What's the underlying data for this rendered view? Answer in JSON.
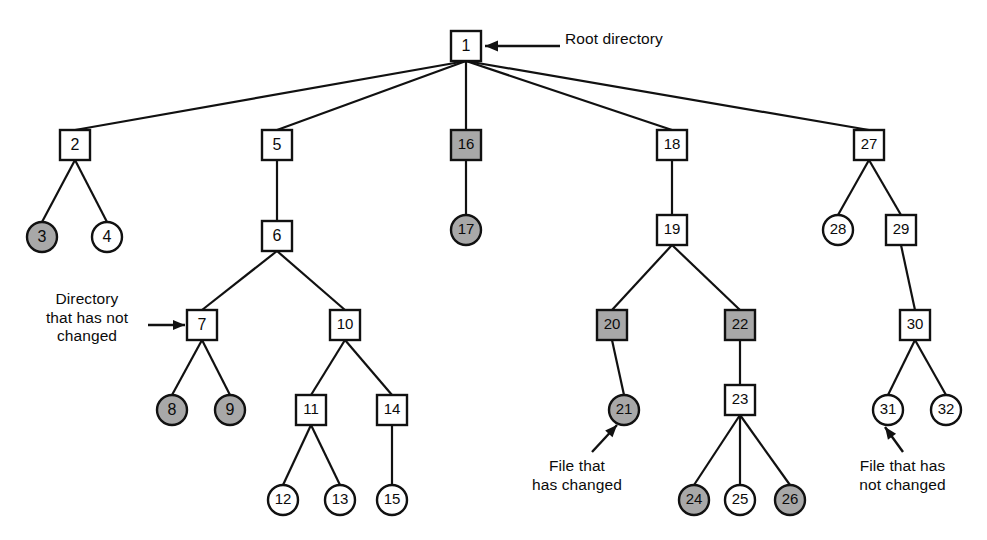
{
  "diagram": {
    "colors": {
      "stroke": "#111111",
      "node_fill_unchanged": "#ffffff",
      "node_fill_changed": "#a8a8a8",
      "background": "#ffffff",
      "text": "#0b0b0b"
    },
    "legend": {
      "root_label": "Root directory",
      "directory_unchanged_label": "Directory\nthat has not\nchanged",
      "file_changed_label": "File that\nhas changed",
      "file_unchanged_label": "File that has\nnot changed"
    },
    "shape_meaning": {
      "square": "directory",
      "circle": "file",
      "gray": "changed since last dump",
      "white": "not changed since last dump"
    },
    "nodes": [
      {
        "id": "1",
        "label": "1",
        "shape": "square",
        "state": "changed",
        "x": 466,
        "y": 46
      },
      {
        "id": "2",
        "label": "2",
        "shape": "square",
        "state": "changed",
        "x": 75,
        "y": 145
      },
      {
        "id": "3",
        "label": "3",
        "shape": "circle",
        "state": "changed",
        "x": 42,
        "y": 237
      },
      {
        "id": "4",
        "label": "4",
        "shape": "circle",
        "state": "unchanged",
        "x": 107,
        "y": 237
      },
      {
        "id": "5",
        "label": "5",
        "shape": "square",
        "state": "changed",
        "x": 277,
        "y": 145
      },
      {
        "id": "6",
        "label": "6",
        "shape": "square",
        "state": "changed",
        "x": 277,
        "y": 236
      },
      {
        "id": "7",
        "label": "7",
        "shape": "square",
        "state": "unchanged",
        "x": 202,
        "y": 325
      },
      {
        "id": "8",
        "label": "8",
        "shape": "circle",
        "state": "changed",
        "x": 172,
        "y": 410
      },
      {
        "id": "9",
        "label": "9",
        "shape": "circle",
        "state": "changed",
        "x": 230,
        "y": 410
      },
      {
        "id": "10",
        "label": "10",
        "shape": "square",
        "state": "changed",
        "x": 345,
        "y": 325
      },
      {
        "id": "11",
        "label": "11",
        "shape": "square",
        "state": "changed",
        "x": 311,
        "y": 410
      },
      {
        "id": "12",
        "label": "12",
        "shape": "circle",
        "state": "unchanged",
        "x": 283,
        "y": 500
      },
      {
        "id": "13",
        "label": "13",
        "shape": "circle",
        "state": "unchanged",
        "x": 340,
        "y": 500
      },
      {
        "id": "14",
        "label": "14",
        "shape": "square",
        "state": "changed",
        "x": 392,
        "y": 410
      },
      {
        "id": "15",
        "label": "15",
        "shape": "circle",
        "state": "unchanged",
        "x": 392,
        "y": 500
      },
      {
        "id": "16",
        "label": "16",
        "shape": "square",
        "state": "changed",
        "x": 466,
        "y": 145
      },
      {
        "id": "17",
        "label": "17",
        "shape": "circle",
        "state": "changed",
        "x": 466,
        "y": 230
      },
      {
        "id": "18",
        "label": "18",
        "shape": "square",
        "state": "changed",
        "x": 672,
        "y": 145
      },
      {
        "id": "19",
        "label": "19",
        "shape": "square",
        "state": "changed",
        "x": 672,
        "y": 230
      },
      {
        "id": "20",
        "label": "20",
        "shape": "square",
        "state": "changed",
        "x": 612,
        "y": 325
      },
      {
        "id": "21",
        "label": "21",
        "shape": "circle",
        "state": "changed",
        "x": 624,
        "y": 410
      },
      {
        "id": "22",
        "label": "22",
        "shape": "square",
        "state": "changed",
        "x": 740,
        "y": 325
      },
      {
        "id": "23",
        "label": "23",
        "shape": "square",
        "state": "unchanged",
        "x": 740,
        "y": 400
      },
      {
        "id": "24",
        "label": "24",
        "shape": "circle",
        "state": "changed",
        "x": 694,
        "y": 500
      },
      {
        "id": "25",
        "label": "25",
        "shape": "circle",
        "state": "unchanged",
        "x": 740,
        "y": 500
      },
      {
        "id": "26",
        "label": "26",
        "shape": "circle",
        "state": "changed",
        "x": 790,
        "y": 500
      },
      {
        "id": "27",
        "label": "27",
        "shape": "square",
        "state": "changed",
        "x": 869,
        "y": 145
      },
      {
        "id": "28",
        "label": "28",
        "shape": "circle",
        "state": "unchanged",
        "x": 838,
        "y": 230
      },
      {
        "id": "29",
        "label": "29",
        "shape": "square",
        "state": "changed",
        "x": 901,
        "y": 230
      },
      {
        "id": "30",
        "label": "30",
        "shape": "square",
        "state": "changed",
        "x": 915,
        "y": 325
      },
      {
        "id": "31",
        "label": "31",
        "shape": "circle",
        "state": "unchanged",
        "x": 888,
        "y": 410
      },
      {
        "id": "32",
        "label": "32",
        "shape": "circle",
        "state": "unchanged",
        "x": 946,
        "y": 410
      }
    ],
    "edges": [
      [
        "1",
        "2"
      ],
      [
        "1",
        "5"
      ],
      [
        "1",
        "16"
      ],
      [
        "1",
        "18"
      ],
      [
        "1",
        "27"
      ],
      [
        "2",
        "3"
      ],
      [
        "2",
        "4"
      ],
      [
        "5",
        "6"
      ],
      [
        "6",
        "7"
      ],
      [
        "6",
        "10"
      ],
      [
        "7",
        "8"
      ],
      [
        "7",
        "9"
      ],
      [
        "10",
        "11"
      ],
      [
        "10",
        "14"
      ],
      [
        "11",
        "12"
      ],
      [
        "11",
        "13"
      ],
      [
        "14",
        "15"
      ],
      [
        "16",
        "17"
      ],
      [
        "18",
        "19"
      ],
      [
        "19",
        "20"
      ],
      [
        "19",
        "22"
      ],
      [
        "20",
        "21"
      ],
      [
        "22",
        "23"
      ],
      [
        "23",
        "24"
      ],
      [
        "23",
        "25"
      ],
      [
        "23",
        "26"
      ],
      [
        "27",
        "28"
      ],
      [
        "27",
        "29"
      ],
      [
        "29",
        "30"
      ],
      [
        "30",
        "31"
      ],
      [
        "30",
        "32"
      ]
    ]
  }
}
